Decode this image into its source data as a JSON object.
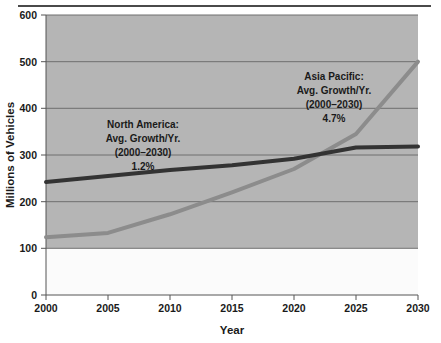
{
  "chart_data": {
    "type": "line",
    "title": "",
    "xlabel": "Year",
    "ylabel": "Millions of Vehicles",
    "x": [
      2000,
      2005,
      2010,
      2015,
      2020,
      2025,
      2030
    ],
    "xlim": [
      2000,
      2030
    ],
    "ylim": [
      0,
      600
    ],
    "xticks": [
      "2000",
      "2005",
      "2010",
      "2015",
      "2020",
      "2025",
      "2030"
    ],
    "yticks": [
      "0",
      "100",
      "200",
      "300",
      "400",
      "500",
      "600"
    ],
    "grid": true,
    "legend": "none",
    "series": [
      {
        "name": "North America",
        "color": "#333333",
        "values": [
          242,
          255,
          268,
          278,
          292,
          316,
          318
        ]
      },
      {
        "name": "Asia Pacific",
        "color": "#8c8c8c",
        "values": [
          124,
          133,
          173,
          220,
          270,
          345,
          500
        ]
      }
    ],
    "annotations": [
      {
        "id": "north-america",
        "lines": [
          "North America:",
          "Avg. Growth/Yr.",
          "(2000–2030)",
          "1.2%"
        ],
        "region": "North America",
        "metric": "Avg. Growth/Yr.",
        "period": "(2000–2030)",
        "value": "1.2%"
      },
      {
        "id": "asia-pacific",
        "lines": [
          "Asia Pacific:",
          "Avg. Growth/Yr.",
          "(2000–2030)",
          "4.7%"
        ],
        "region": "Asia Pacific",
        "metric": "Avg. Growth/Yr.",
        "period": "(2000–2030)",
        "value": "4.7%"
      }
    ],
    "colors": {
      "plot_background": "#b5b5b5",
      "lower_background": "#fbfbfb",
      "gridline": "#6e6e6e",
      "axis": "#555555",
      "north_america_line": "#333333",
      "asia_pacific_line": "#8c8c8c",
      "top_rule": "#4a4a4a"
    }
  }
}
